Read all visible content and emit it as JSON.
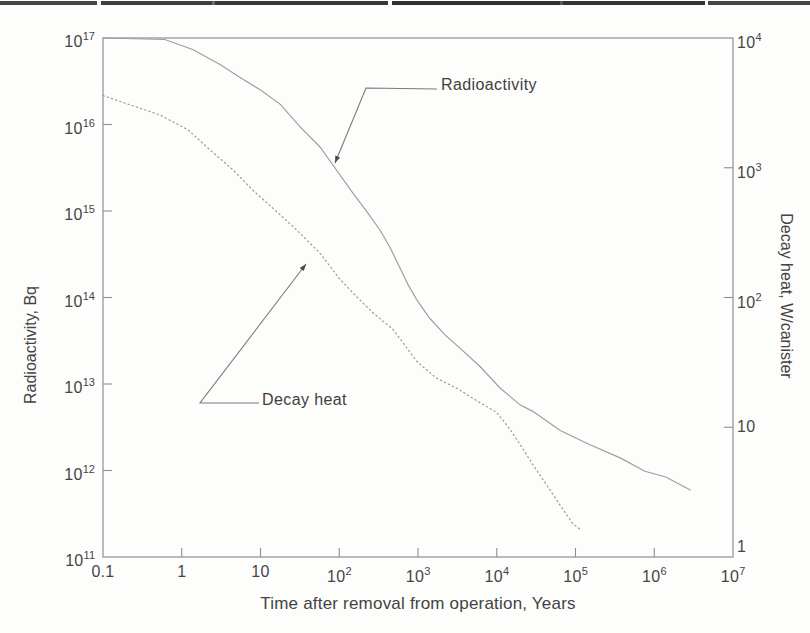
{
  "chart_data": {
    "type": "line",
    "title": "",
    "x_axis": {
      "label": "Time after removal from operation, Years",
      "ticks": [
        {
          "base": "0.1",
          "exp": null,
          "log": -1,
          "mark": false
        },
        {
          "base": "1",
          "exp": null,
          "log": 0,
          "mark": true
        },
        {
          "base": "10",
          "exp": null,
          "log": 1,
          "mark": true
        },
        {
          "base": "10",
          "exp": "2",
          "log": 2,
          "mark": true
        },
        {
          "base": "10",
          "exp": "3",
          "log": 3,
          "mark": true
        },
        {
          "base": "10",
          "exp": "4",
          "log": 4,
          "mark": true
        },
        {
          "base": "10",
          "exp": "5",
          "log": 5,
          "mark": true
        },
        {
          "base": "10",
          "exp": "6",
          "log": 6,
          "mark": true
        },
        {
          "base": "10",
          "exp": "7",
          "log": 7,
          "mark": false
        }
      ]
    },
    "left_axis": {
      "label": "Radioactivity, Bq",
      "ticks": [
        {
          "base": "10",
          "exp": "17",
          "log": 17,
          "mark": false
        },
        {
          "base": "10",
          "exp": "16",
          "log": 16,
          "mark": true
        },
        {
          "base": "10",
          "exp": "15",
          "log": 15,
          "mark": true
        },
        {
          "base": "10",
          "exp": "14",
          "log": 14,
          "mark": true
        },
        {
          "base": "10",
          "exp": "13",
          "log": 13,
          "mark": true
        },
        {
          "base": "10",
          "exp": "12",
          "log": 12,
          "mark": true
        },
        {
          "base": "10",
          "exp": "11",
          "log": 11,
          "mark": false
        }
      ]
    },
    "right_axis": {
      "label": "Decay heat, W/canister",
      "ticks": [
        {
          "base": "10",
          "exp": "4",
          "log": 4,
          "mark": false
        },
        {
          "base": "10",
          "exp": "3",
          "log": 3,
          "mark": true
        },
        {
          "base": "10",
          "exp": "2",
          "log": 2,
          "mark": true
        },
        {
          "base": "10",
          "exp": null,
          "log": 1,
          "mark": true
        },
        {
          "base": "1",
          "exp": null,
          "log": 0,
          "mark": false
        }
      ]
    },
    "x_log_range": [
      -1,
      7
    ],
    "y_left_log_range": [
      11,
      17
    ],
    "y_right_log_range": [
      0,
      4
    ],
    "grid": false,
    "series": [
      {
        "name": "Radioactivity",
        "slug": "radioactivity",
        "axis": "left",
        "style": "solid",
        "color": "#9e9e9e",
        "points": [
          [
            0.1,
            1e+17
          ],
          [
            0.61,
            9.6e+16
          ],
          [
            1.4,
            7.3e+16
          ],
          [
            3.1,
            4.9e+16
          ],
          [
            5.5,
            3.5e+16
          ],
          [
            10,
            2.5e+16
          ],
          [
            18,
            1.7e+16
          ],
          [
            32,
            9300000000000000.0
          ],
          [
            57,
            5500000000000000.0
          ],
          [
            83,
            3400000000000000.0
          ],
          [
            150,
            1600000000000000.0
          ],
          [
            225,
            980000000000000.0
          ],
          [
            330,
            600000000000000.0
          ],
          [
            440,
            380000000000000.0
          ],
          [
            590,
            220000000000000.0
          ],
          [
            750,
            140000000000000.0
          ],
          [
            970,
            93000000000000.0
          ],
          [
            1400,
            58000000000000.0
          ],
          [
            2200,
            37000000000000.0
          ],
          [
            3400,
            26000000000000.0
          ],
          [
            6100,
            16000000000000.0
          ],
          [
            11000,
            9000000000000.0
          ],
          [
            20000,
            5700000000000.0
          ],
          [
            29000,
            4800000000000.0
          ],
          [
            64000,
            2900000000000.0
          ],
          [
            150000,
            2000000000000.0
          ],
          [
            370000,
            1400000000000.0
          ],
          [
            760000,
            980000000000.0
          ],
          [
            1400000,
            840000000000.0
          ],
          [
            2900000,
            590000000000.0
          ]
        ]
      },
      {
        "name": "Decay heat",
        "slug": "decay-heat",
        "axis": "right",
        "style": "dotted",
        "color": "#9a9a9a",
        "points": [
          [
            0.1,
            3600
          ],
          [
            0.24,
            3000
          ],
          [
            0.53,
            2550
          ],
          [
            1.2,
            1960
          ],
          [
            2.3,
            1370
          ],
          [
            4.5,
            960
          ],
          [
            8,
            670
          ],
          [
            16,
            460
          ],
          [
            29,
            330
          ],
          [
            57,
            220
          ],
          [
            100,
            140
          ],
          [
            170,
            100
          ],
          [
            270,
            76
          ],
          [
            480,
            57
          ],
          [
            970,
            32
          ],
          [
            1700,
            24
          ],
          [
            3100,
            20
          ],
          [
            5600,
            16
          ],
          [
            10000,
            13
          ],
          [
            15000,
            9.5
          ],
          [
            20000,
            7.3
          ],
          [
            29000,
            5.1
          ],
          [
            43000,
            3.6
          ],
          [
            64000,
            2.5
          ],
          [
            93000,
            1.8
          ],
          [
            120000,
            1.6
          ]
        ]
      }
    ],
    "annotations": [
      {
        "name": "radioactivity-callout",
        "text": "Radioactivity",
        "leader_px": [
          [
            437,
            89
          ],
          [
            366,
            88
          ],
          [
            335,
            163
          ]
        ]
      },
      {
        "name": "decay-heat-callout",
        "text": "Decay heat",
        "leader_px": [
          [
            259,
            403
          ],
          [
            200,
            403
          ],
          [
            306,
            264
          ]
        ]
      }
    ],
    "legend_position": "none"
  }
}
